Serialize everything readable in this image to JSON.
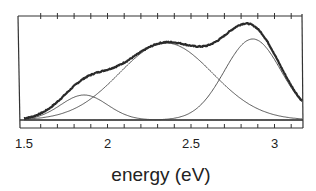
{
  "chart_data": {
    "type": "line",
    "title": "",
    "xlabel": "energy (eV)",
    "ylabel": "",
    "xlim": [
      1.5,
      3.17
    ],
    "ylim": [
      0,
      100
    ],
    "grid": false,
    "legend": null,
    "x_ticks": [
      {
        "value": 1.5,
        "label": "1.5"
      },
      {
        "value": 2,
        "label": "2"
      },
      {
        "value": 2.5,
        "label": "2.5"
      },
      {
        "value": 3,
        "label": "3"
      }
    ],
    "minor_tick_step": 0.1,
    "series": [
      {
        "name": "measured spectrum",
        "style": "thick noisy",
        "kind": "sum of components"
      },
      {
        "name": "gaussian component 1",
        "center": 1.86,
        "height": 25,
        "sigma": 0.14
      },
      {
        "name": "gaussian component 2",
        "center": 2.35,
        "height": 77,
        "sigma": 0.28
      },
      {
        "name": "gaussian component 3",
        "center": 2.87,
        "height": 81,
        "sigma": 0.17
      }
    ],
    "annotations": []
  },
  "colors": {
    "axis": "#333333",
    "data_line": "#2a2a2a",
    "component_line": "#444444"
  }
}
